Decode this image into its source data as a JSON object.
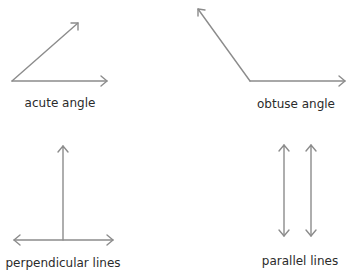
{
  "stroke_color": "#8c8c8c",
  "label_color": "#2b2b2b",
  "diagrams": [
    {
      "id": "acute",
      "label": "acute angle"
    },
    {
      "id": "obtuse",
      "label": "obtuse angle"
    },
    {
      "id": "perpendicular",
      "label": "perpendicular lines"
    },
    {
      "id": "parallel",
      "label": "parallel lines"
    }
  ]
}
